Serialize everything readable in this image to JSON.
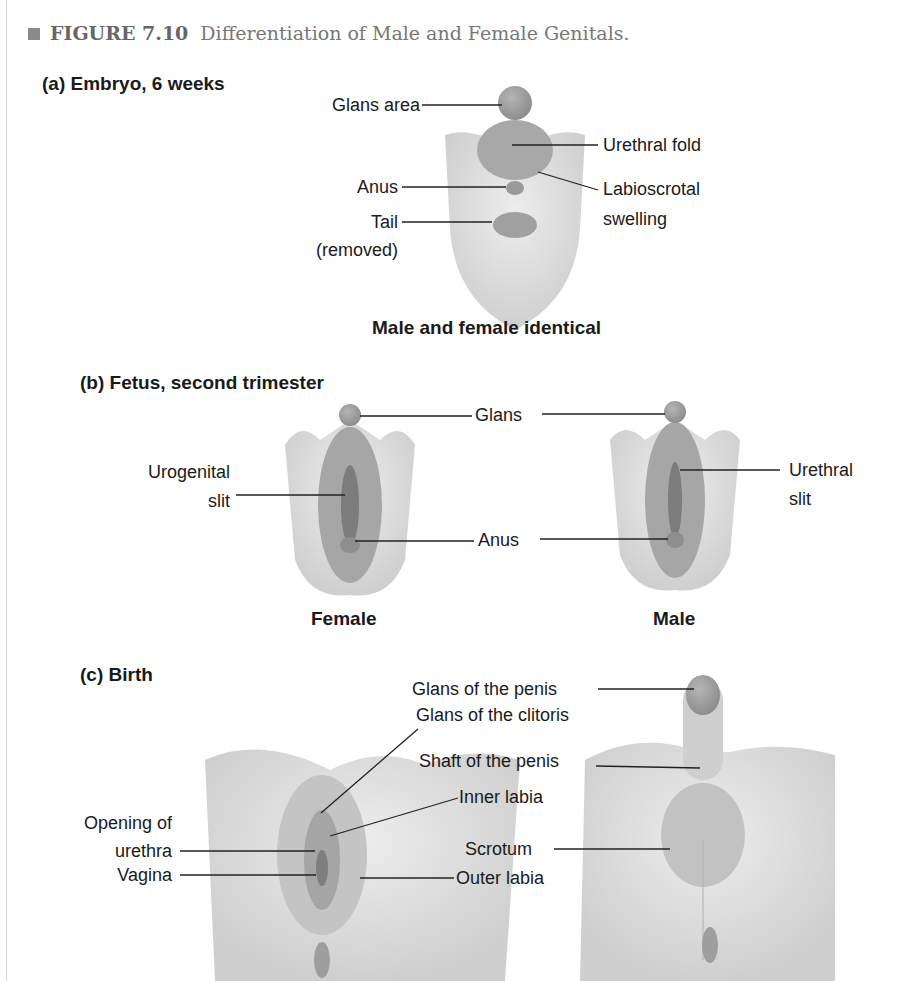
{
  "figure": {
    "number": "FIGURE 7.10",
    "title": "Differentiation of Male and Female Genitals.",
    "accent_color": "#8a8a8a"
  },
  "panels": [
    {
      "heading": "(a) Embryo, 6 weeks",
      "subcaption": "Male and female identical",
      "labels": {
        "glans_area": "Glans area",
        "urethral_fold": "Urethral fold",
        "anus": "Anus",
        "labioscrotal_1": "Labioscrotal",
        "labioscrotal_2": "swelling",
        "tail_1": "Tail",
        "tail_2": "(removed)"
      }
    },
    {
      "heading": "(b) Fetus, second trimester",
      "labels": {
        "glans": "Glans",
        "urogenital_1": "Urogenital",
        "urogenital_2": "slit",
        "anus": "Anus",
        "urethral_slit_1": "Urethral",
        "urethral_slit_2": "slit"
      },
      "subcaptions": {
        "female": "Female",
        "male": "Male"
      }
    },
    {
      "heading": "(c) Birth",
      "labels": {
        "glans_penis": "Glans of the penis",
        "glans_clitoris": "Glans of the clitoris",
        "shaft_penis": "Shaft of the penis",
        "inner_labia": "Inner labia",
        "opening_urethra_1": "Opening of",
        "opening_urethra_2": "urethra",
        "vagina": "Vagina",
        "scrotum": "Scrotum",
        "outer_labia": "Outer labia"
      }
    }
  ]
}
